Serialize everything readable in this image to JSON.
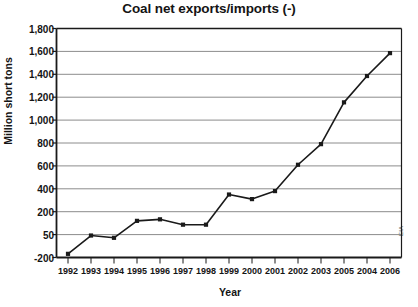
{
  "chart_data": {
    "type": "line",
    "title": "Coal net exports/imports (-)",
    "xlabel": "Year",
    "ylabel": "Million short tons",
    "source": "EIA",
    "grid": true,
    "legend": "none",
    "categories": [
      "1992",
      "1993",
      "1994",
      "1995",
      "1996",
      "1997",
      "1998",
      "1999",
      "2000",
      "2001",
      "2002",
      "2003",
      "2005",
      "2004",
      "2006"
    ],
    "values": [
      -160,
      40,
      15,
      140,
      150,
      115,
      115,
      350,
      310,
      380,
      610,
      790,
      1155,
      1385,
      1585
    ],
    "ytick_labels": [
      "1,800",
      "1,600",
      "1,400",
      "1,200",
      "1,000",
      "800",
      "600",
      "400",
      "200",
      "50",
      "-200"
    ],
    "ytick_values": [
      1800,
      1600,
      1400,
      1200,
      1000,
      800,
      600,
      400,
      200,
      50,
      -200
    ],
    "ylim": [
      -200,
      1800
    ],
    "axis_note": "non-linear: equal spacing between 200, 50 and -200",
    "series": [
      {
        "name": "Coal net exports/imports",
        "marker": "square",
        "color": "#1a1a1a",
        "points": [
          {
            "x": "1992",
            "y": -160
          },
          {
            "x": "1993",
            "y": 40
          },
          {
            "x": "1994",
            "y": 15
          },
          {
            "x": "1995",
            "y": 140
          },
          {
            "x": "1996",
            "y": 150
          },
          {
            "x": "1997",
            "y": 115
          },
          {
            "x": "1998",
            "y": 115
          },
          {
            "x": "1999",
            "y": 350
          },
          {
            "x": "2000",
            "y": 310
          },
          {
            "x": "2001",
            "y": 380
          },
          {
            "x": "2002",
            "y": 610
          },
          {
            "x": "2003",
            "y": 790
          },
          {
            "x": "2005",
            "y": 1155
          },
          {
            "x": "2004",
            "y": 1385
          },
          {
            "x": "2006",
            "y": 1585
          }
        ]
      }
    ]
  },
  "colors": {
    "line": "#1a1a1a",
    "grid": "#8c8c8c",
    "axis": "#1a1a1a",
    "text": "#141414",
    "background": "#ffffff"
  }
}
